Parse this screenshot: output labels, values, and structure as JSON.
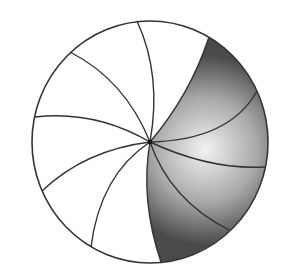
{
  "diagram": {
    "circle": {
      "cx": 150,
      "cy": 142,
      "rx": 118,
      "ry": 121
    },
    "center_point": {
      "x": 150,
      "y": 142
    },
    "spoke_count": 11,
    "spokes_unshaded": [
      {
        "end": [
          137,
          21
        ],
        "ctrl": [
          162,
          75
        ]
      },
      {
        "end": [
          70,
          52
        ],
        "ctrl": [
          125,
          80
        ]
      },
      {
        "end": [
          35,
          117
        ],
        "ctrl": [
          95,
          110
        ]
      },
      {
        "end": [
          42,
          191
        ],
        "ctrl": [
          85,
          150
        ]
      },
      {
        "end": [
          91,
          247
        ],
        "ctrl": [
          100,
          175
        ]
      }
    ],
    "spokes_shaded": [
      {
        "end": [
          209,
          37
        ],
        "ctrl": [
          190,
          95
        ]
      },
      {
        "end": [
          257,
          91
        ],
        "ctrl": [
          230,
          140
        ]
      },
      {
        "end": [
          265,
          167
        ],
        "ctrl": [
          210,
          170
        ]
      },
      {
        "end": [
          229,
          230
        ],
        "ctrl": [
          170,
          200
        ]
      },
      {
        "end": [
          161,
          262
        ],
        "ctrl": [
          140,
          200
        ]
      }
    ],
    "colors": {
      "stroke": "#333333",
      "background": "#ffffff",
      "shade_light": "#eeeeee",
      "shade_dark": "#4a4a4a"
    }
  }
}
